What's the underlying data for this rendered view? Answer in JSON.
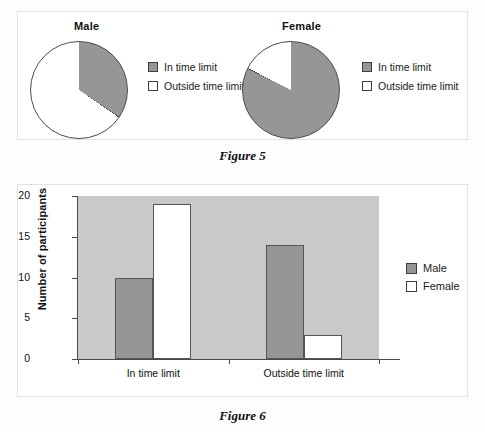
{
  "figure5": {
    "caption": "Figure 5",
    "charts": [
      {
        "title": "Male",
        "legend": [
          {
            "label": "In time limit",
            "swatch": "gray"
          },
          {
            "label": "Outside time limit",
            "swatch": "white"
          }
        ]
      },
      {
        "title": "Female",
        "legend": [
          {
            "label": "In time limit",
            "swatch": "gray"
          },
          {
            "label": "Outside time limit",
            "swatch": "white"
          }
        ]
      }
    ]
  },
  "figure6": {
    "caption": "Figure 6",
    "ylabel": "Number of participants",
    "ytick_labels": [
      "20",
      "15",
      "10",
      "5",
      "0"
    ],
    "xcat_labels": [
      "In time limit",
      "Outside time limit"
    ],
    "legend": [
      {
        "label": "Male",
        "swatch": "gray"
      },
      {
        "label": "Female",
        "swatch": "white"
      }
    ]
  },
  "colors": {
    "bar_gray": "#969696",
    "bar_white": "#ffffff",
    "plot_background": "#c9c9c9",
    "axis": "#4a4a4a",
    "page_background": "#ffffff"
  },
  "chart_data": [
    {
      "type": "pie",
      "title": "Male",
      "labels": [
        "In time limit",
        "Outside time limit"
      ],
      "values": [
        10,
        19
      ],
      "percentages": [
        34.5,
        65.5
      ],
      "start_angle_deg": 0,
      "direction": "clockwise",
      "slice_colors": [
        "#969696",
        "#ffffff"
      ],
      "legend_position": "right"
    },
    {
      "type": "pie",
      "title": "Female",
      "labels": [
        "In time limit",
        "Outside time limit"
      ],
      "values": [
        14,
        3
      ],
      "percentages": [
        82.4,
        17.6
      ],
      "start_angle_deg": 0,
      "direction": "clockwise",
      "slice_colors": [
        "#969696",
        "#ffffff"
      ],
      "legend_position": "right"
    },
    {
      "type": "bar",
      "title": "",
      "xlabel": "",
      "ylabel": "Number of participants",
      "categories": [
        "In time limit",
        "Outside time limit"
      ],
      "series": [
        {
          "name": "Male",
          "values": [
            10,
            14
          ],
          "color": "#969696"
        },
        {
          "name": "Female",
          "values": [
            19,
            3
          ],
          "color": "#ffffff"
        }
      ],
      "ylim": [
        0,
        20
      ],
      "yticks": [
        0,
        5,
        10,
        15,
        20
      ],
      "grid": false,
      "legend_position": "right"
    }
  ]
}
